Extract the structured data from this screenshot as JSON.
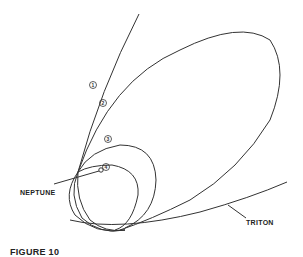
{
  "diagram": {
    "labels": {
      "neptune": "NEPTUNE",
      "triton": "TRITON",
      "caption": "FIGURE 10"
    },
    "trajectory_markers": [
      "①",
      "②",
      "③",
      "④"
    ],
    "colors": {
      "line": "#333333",
      "background": "#ffffff"
    }
  }
}
